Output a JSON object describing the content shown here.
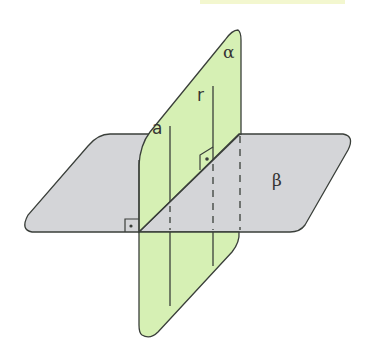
{
  "diagram": {
    "colors": {
      "plane_alpha_fill": "#d6f0b4",
      "plane_beta_fill": "#d4d5d8",
      "stroke": "#3a3f3a",
      "top_band": "#f3f7cf"
    },
    "labels": {
      "plane_alpha": "α",
      "plane_beta": "β",
      "line_a": "a",
      "line_r": "r"
    },
    "markers": {
      "right_angle_1": "right-angle-symbol",
      "right_angle_2": "right-angle-symbol"
    }
  }
}
